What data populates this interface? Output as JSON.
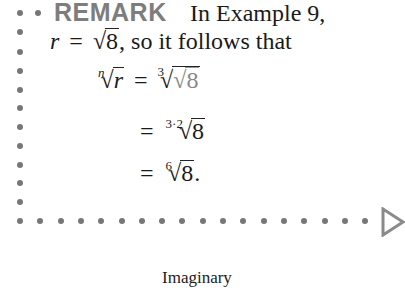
{
  "remark": {
    "label": "REMARK",
    "intro": "In Example 9,",
    "line2_lhs": "r",
    "line2_eq": "=",
    "line2_rad": "8",
    "line2_rest": ", so it follows that"
  },
  "equations": [
    {
      "lhs_index": "n",
      "lhs_var": "r",
      "eq": "=",
      "outer_index": "3",
      "inner_rad": "8"
    },
    {
      "eq": "=",
      "index": "3·2",
      "rad": "8"
    },
    {
      "eq": "=",
      "index": "6",
      "rad": "8",
      "suffix": "."
    }
  ],
  "caption": "Imaginary",
  "colors": {
    "dots": "#777777",
    "remark": "#7d7d7d",
    "triangle": "#8a8a8a"
  }
}
